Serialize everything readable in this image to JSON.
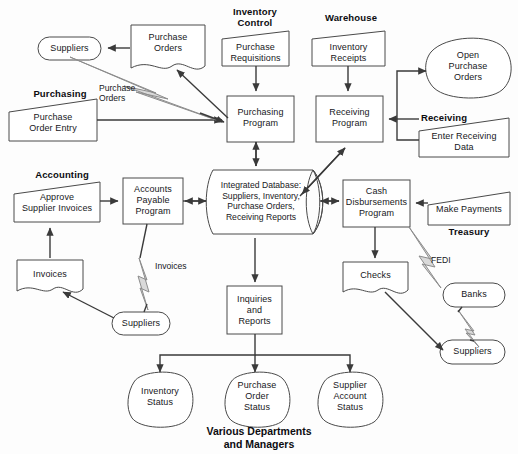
{
  "diagram": {
    "footer": "Various Departments\nand Managers"
  },
  "departments": [
    {
      "id": "purchasing",
      "label": "Purchasing"
    },
    {
      "id": "inventory_control",
      "label": "Inventory\nControl"
    },
    {
      "id": "warehouse",
      "label": "Warehouse"
    },
    {
      "id": "receiving",
      "label": "Receiving"
    },
    {
      "id": "accounting",
      "label": "Accounting"
    },
    {
      "id": "treasury",
      "label": "Treasury"
    }
  ],
  "nodes": [
    {
      "id": "suppliers_top",
      "label": "Suppliers",
      "shape": "rounded-rect"
    },
    {
      "id": "purchase_orders_doc",
      "label": "Purchase\nOrders",
      "shape": "document"
    },
    {
      "id": "purchase_requisitions",
      "label": "Purchase\nRequisitions",
      "shape": "trapezoid"
    },
    {
      "id": "inventory_receipts",
      "label": "Inventory\nReceipts",
      "shape": "trapezoid"
    },
    {
      "id": "open_purchase_orders",
      "label": "Open\nPurchase\nOrders",
      "shape": "blob"
    },
    {
      "id": "purchase_order_entry",
      "label": "Purchase\nOrder Entry",
      "shape": "trapezoid"
    },
    {
      "id": "purchasing_program",
      "label": "Purchasing\nProgram",
      "shape": "rect"
    },
    {
      "id": "receiving_program",
      "label": "Receiving\nProgram",
      "shape": "rect"
    },
    {
      "id": "enter_receiving_data",
      "label": "Enter Receiving\nData",
      "shape": "trapezoid"
    },
    {
      "id": "approve_supplier_invoices",
      "label": "Approve\nSupplier Invoices",
      "shape": "trapezoid"
    },
    {
      "id": "accounts_payable_program",
      "label": "Accounts\nPayable\nProgram",
      "shape": "rect"
    },
    {
      "id": "integrated_database",
      "label": "Integrated Database:\nSuppliers, Inventory,\nPurchase Orders,\nReceiving Reports",
      "shape": "cylinder"
    },
    {
      "id": "cash_disbursements_program",
      "label": "Cash\nDisbursements\nProgram",
      "shape": "rect"
    },
    {
      "id": "make_payments",
      "label": "Make Payments",
      "shape": "trapezoid"
    },
    {
      "id": "invoices_doc",
      "label": "Invoices",
      "shape": "document"
    },
    {
      "id": "suppliers_left",
      "label": "Suppliers",
      "shape": "rounded-rect"
    },
    {
      "id": "inquiries_and_reports",
      "label": "Inquiries\nand\nReports",
      "shape": "rect"
    },
    {
      "id": "checks_doc",
      "label": "Checks",
      "shape": "document"
    },
    {
      "id": "banks",
      "label": "Banks",
      "shape": "rounded-rect"
    },
    {
      "id": "suppliers_right",
      "label": "Suppliers",
      "shape": "rounded-rect"
    },
    {
      "id": "inventory_status",
      "label": "Inventory\nStatus",
      "shape": "blob"
    },
    {
      "id": "purchase_order_status",
      "label": "Purchase\nOrder\nStatus",
      "shape": "blob"
    },
    {
      "id": "supplier_account_status",
      "label": "Supplier\nAccount\nStatus",
      "shape": "blob"
    }
  ],
  "edge_labels": [
    {
      "id": "purchase_orders_edge",
      "label": "Purchase\nOrders"
    },
    {
      "id": "invoices_edge",
      "label": "Invoices"
    },
    {
      "id": "fedi_edge",
      "label": "FEDI"
    }
  ],
  "colors": {
    "background": "#fdfdfd",
    "shape_stroke": "#4a4a4a",
    "arrow": "#3a3a3a",
    "bolt_fill": "#d9d9d9",
    "bolt_stroke": "#8c8c8c",
    "text": "#17171b"
  }
}
